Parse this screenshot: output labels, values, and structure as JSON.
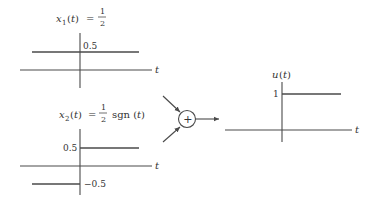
{
  "diagram": {
    "type": "signal-sum",
    "plots": [
      {
        "id": "x1",
        "title": {
          "name": "x",
          "sub": "1",
          "arg": "(t)",
          "eq": "=",
          "frac_num": "1",
          "frac_den": "2",
          "suffix": ""
        },
        "axis_label": "t",
        "levels": [
          {
            "label": "0.5",
            "value": 0.5,
            "range": "all t"
          }
        ]
      },
      {
        "id": "x2",
        "title": {
          "name": "x",
          "sub": "2",
          "arg": "(t)",
          "eq": "=",
          "frac_num": "1",
          "frac_den": "2",
          "suffix": "sgn (t)"
        },
        "axis_label": "t",
        "levels": [
          {
            "label": "0.5",
            "value": 0.5,
            "range": "t > 0"
          },
          {
            "label": "−0.5",
            "value": -0.5,
            "range": "t < 0"
          }
        ]
      },
      {
        "id": "u",
        "title": {
          "name": "u",
          "arg": "(t)"
        },
        "axis_label": "t",
        "levels": [
          {
            "label": "1",
            "value": 1,
            "range": "t > 0"
          }
        ]
      }
    ],
    "summer": {
      "symbol": "+"
    }
  }
}
